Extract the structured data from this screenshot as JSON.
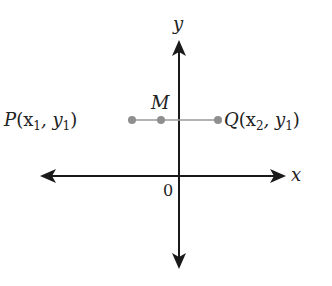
{
  "diagram": {
    "axes": {
      "x_label": "x",
      "y_label": "y",
      "origin_label": "0",
      "color": "#1a1a1a"
    },
    "segment": {
      "color": "#9a9a9a",
      "point_color": "#8f8f8f"
    },
    "points": [
      {
        "id": "P",
        "name": "P",
        "coords": "(x",
        "sub1": "1",
        "mid": ", y",
        "sub2": "1",
        "close": ")"
      },
      {
        "id": "M",
        "name": "M"
      },
      {
        "id": "Q",
        "name": "Q",
        "coords": "(x",
        "sub1": "2",
        "mid": ", y",
        "sub2": "1",
        "close": ")"
      }
    ]
  }
}
